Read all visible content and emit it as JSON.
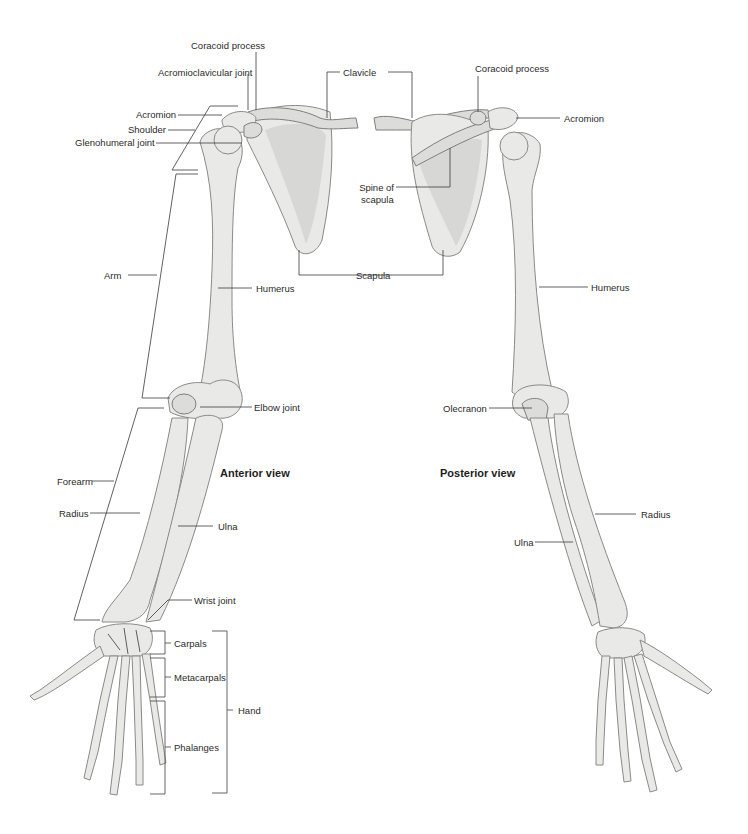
{
  "views": {
    "anterior": "Anterior view",
    "posterior": "Posterior view"
  },
  "labels": {
    "anterior": {
      "coracoid_process": "Coracoid process",
      "acromioclavicular_joint": "Acromioclavicular joint",
      "clavicle": "Clavicle",
      "acromion": "Acromion",
      "shoulder": "Shoulder",
      "glenohumeral_joint": "Glenohumeral joint",
      "arm": "Arm",
      "humerus": "Humerus",
      "scapula": "Scapula",
      "elbow_joint": "Elbow joint",
      "forearm": "Forearm",
      "radius": "Radius",
      "ulna": "Ulna",
      "wrist_joint": "Wrist joint",
      "carpals": "Carpals",
      "metacarpals": "Metacarpals",
      "phalanges": "Phalanges",
      "hand": "Hand"
    },
    "posterior": {
      "coracoid_process": "Coracoid process",
      "acromion": "Acromion",
      "spine_of_scapula_line1": "Spine of",
      "spine_of_scapula_line2": "scapula",
      "humerus": "Humerus",
      "olecranon": "Olecranon",
      "radius": "Radius",
      "ulna": "Ulna"
    }
  },
  "colors": {
    "background": "#ffffff",
    "bone_fill": "#e9e9e7",
    "bone_outline": "#8a8a88",
    "leader_line": "#3a3a3a",
    "label_text": "#2b2b2b"
  }
}
